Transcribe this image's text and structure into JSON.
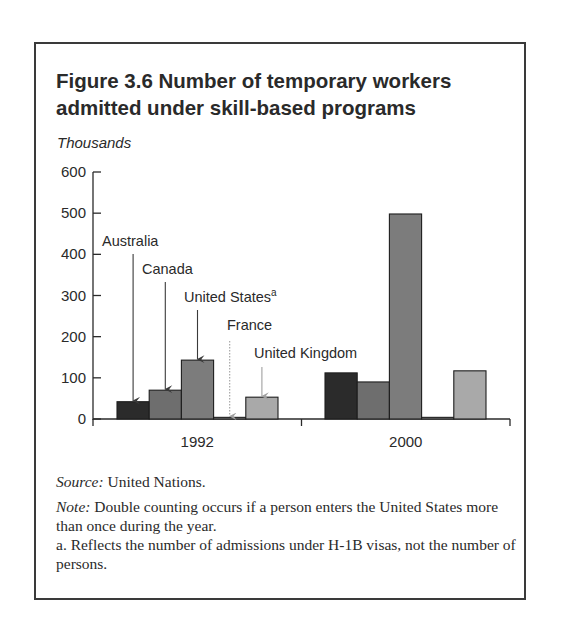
{
  "figure": {
    "title": "Figure 3.6  Number of temporary workers admitted under skill-based programs",
    "title_line1": "Figure 3.6  Number of temporary workers",
    "title_line2": "admitted under skill-based programs",
    "unit_label": "Thousands"
  },
  "chart_data": {
    "type": "bar",
    "title": "Number of temporary workers admitted under skill-based programs",
    "xlabel": "",
    "ylabel": "Thousands",
    "ylim": [
      0,
      600
    ],
    "yticks": [
      0,
      100,
      200,
      300,
      400,
      500,
      600
    ],
    "grid": false,
    "legend_position": "inline arrow labels over 1992 group",
    "categories": [
      "1992",
      "2000"
    ],
    "series": [
      {
        "name": "Australia",
        "values": [
          42,
          112
        ],
        "color": "#2b2b2b"
      },
      {
        "name": "Canada",
        "values": [
          70,
          90
        ],
        "color": "#6e6e6e"
      },
      {
        "name": "United States",
        "label_superscript": "a",
        "values": [
          143,
          498
        ],
        "color": "#7c7c7c"
      },
      {
        "name": "France",
        "values": [
          4,
          4
        ],
        "color": "#8a8a8a"
      },
      {
        "name": "United Kingdom",
        "values": [
          53,
          117
        ],
        "color": "#a9a9a9"
      }
    ]
  },
  "footer": {
    "source_label": "Source:",
    "source_text": " United Nations.",
    "note_label": "Note:",
    "note_text": " Double counting occurs if a person enters the United States more than once during the year.",
    "footnote_a": "a. Reflects the number of admissions under H-1B visas, not the number of persons."
  }
}
